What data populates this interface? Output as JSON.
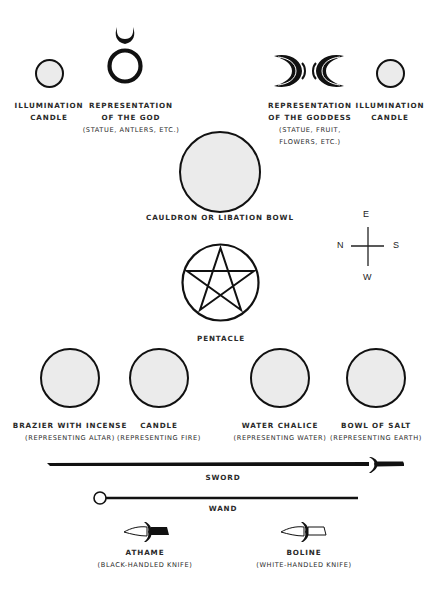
{
  "diagram": {
    "type": "altar-layout",
    "items": {
      "illumination_candle_left": {
        "label_line1": "ILLUMINATION",
        "label_line2": "CANDLE",
        "icon": "circle"
      },
      "god": {
        "label_line1": "REPRESENTATION",
        "label_line2": "OF THE GOD",
        "label_line3": "(STATUE, ANTLERS, ETC.)",
        "icon": "horned-god-symbol"
      },
      "goddess": {
        "label_line1": "REPRESENTATION",
        "label_line2": "OF THE GODDESS",
        "label_line3": "(STATUE, FRUIT,",
        "label_line4": "FLOWERS, ETC.)",
        "icon": "triple-moon-symbol"
      },
      "illumination_candle_right": {
        "label_line1": "ILLUMINATION",
        "label_line2": "CANDLE",
        "icon": "circle"
      },
      "cauldron": {
        "label": "CAULDRON OR LIBATION BOWL",
        "icon": "circle"
      },
      "pentacle": {
        "label": "PENTACLE",
        "icon": "pentagram"
      },
      "brazier": {
        "label_line1": "BRAZIER WITH INCENSE",
        "label_line2": "(REPRESENTING ALTAR)",
        "icon": "circle"
      },
      "candle": {
        "label_line1": "CANDLE",
        "label_line2": "(REPRESENTING FIRE)",
        "icon": "circle"
      },
      "water_chalice": {
        "label_line1": "WATER CHALICE",
        "label_line2": "(REPRESENTING WATER)",
        "icon": "circle"
      },
      "bowl_of_salt": {
        "label_line1": "BOWL OF SALT",
        "label_line2": "(REPRESENTING EARTH)",
        "icon": "circle"
      },
      "sword": {
        "label": "SWORD",
        "icon": "sword"
      },
      "wand": {
        "label": "WAND",
        "icon": "wand"
      },
      "athame": {
        "label_line1": "ATHAME",
        "label_line2": "(BLACK-HANDLED KNIFE)",
        "icon": "black-handled-knife"
      },
      "boline": {
        "label_line1": "BOLINE",
        "label_line2": "(WHITE-HANDLED KNIFE)",
        "icon": "white-handled-knife"
      }
    },
    "compass": {
      "top": "E",
      "left": "N",
      "right": "S",
      "bottom": "W"
    },
    "colors": {
      "fill": "#ebebeb",
      "stroke": "#111111",
      "text": "#2a2a2a"
    }
  }
}
